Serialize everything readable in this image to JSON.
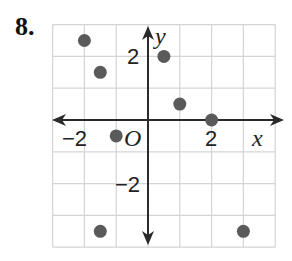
{
  "problem": {
    "number": "8."
  },
  "chart_data": {
    "type": "scatter",
    "title": "",
    "xlabel": "x",
    "ylabel": "y",
    "origin_label": "O",
    "xlim": [
      -3,
      4
    ],
    "ylim": [
      -4,
      3
    ],
    "grid": true,
    "x_tick_labels": [
      {
        "value": -2,
        "label": "−2"
      },
      {
        "value": 2,
        "label": "2"
      }
    ],
    "y_tick_labels": [
      {
        "value": 2,
        "label": "2"
      },
      {
        "value": -2,
        "label": "−2"
      }
    ],
    "points": [
      {
        "x": -2,
        "y": 2.5
      },
      {
        "x": -1.5,
        "y": 1.5
      },
      {
        "x": 0.5,
        "y": 2
      },
      {
        "x": 1,
        "y": 0.5
      },
      {
        "x": 2,
        "y": 0
      },
      {
        "x": -1,
        "y": -0.5
      },
      {
        "x": -1.5,
        "y": -3.5
      },
      {
        "x": 3,
        "y": -3.5
      }
    ],
    "colors": {
      "point": "#5a5a5a",
      "grid": "#d4d4d4",
      "axis": "#2a2a2a"
    }
  }
}
